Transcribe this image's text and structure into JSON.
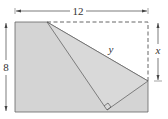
{
  "diagram": {
    "labels": {
      "width": "12",
      "height": "8",
      "fold_segment": "y",
      "vertical_segment": "x"
    },
    "colors": {
      "fill": "#d4d4d4",
      "line": "#555555",
      "dashed": "#555555"
    }
  }
}
